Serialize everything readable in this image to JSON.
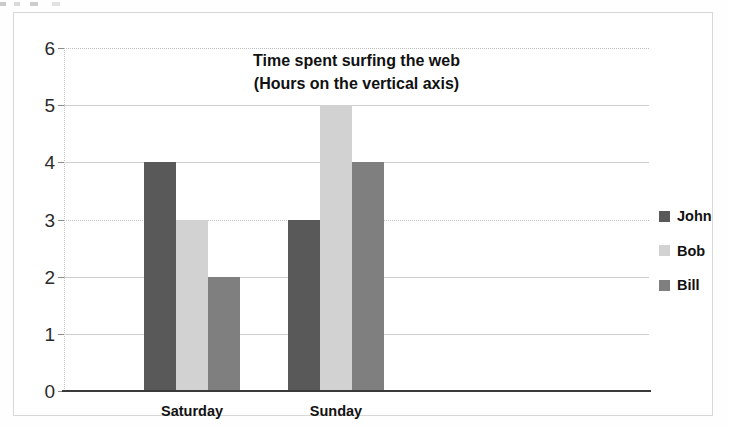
{
  "chart_data": {
    "type": "bar",
    "title": "Time spent surfing the web",
    "subtitle": "(Hours on the vertical axis)",
    "xlabel": "",
    "ylabel": "",
    "categories": [
      "Saturday",
      "Sunday"
    ],
    "series": [
      {
        "name": "John",
        "values": [
          4,
          3
        ],
        "color": "#595959"
      },
      {
        "name": "Bob",
        "values": [
          3,
          5
        ],
        "color": "#d2d2d2"
      },
      {
        "name": "Bill",
        "values": [
          2,
          4
        ],
        "color": "#7f7f7f"
      }
    ],
    "ylim": [
      0,
      6
    ],
    "ytick_step": 1,
    "yticks": [
      "6",
      "5",
      "4",
      "3",
      "2",
      "1",
      "0"
    ],
    "grid": true,
    "legend_position": "right"
  },
  "axes": {
    "y_ticks": [
      {
        "label": "6",
        "value": 6
      },
      {
        "label": "5",
        "value": 5
      },
      {
        "label": "4",
        "value": 4
      },
      {
        "label": "3",
        "value": 3
      },
      {
        "label": "2",
        "value": 2
      },
      {
        "label": "1",
        "value": 1
      },
      {
        "label": "0",
        "value": 0
      }
    ],
    "x_categories": [
      {
        "label": "Saturday"
      },
      {
        "label": "Sunday"
      }
    ]
  },
  "legend": {
    "items": [
      {
        "label": "John",
        "color": "#595959",
        "swatch": "legend-swatch-john"
      },
      {
        "label": "Bob",
        "color": "#d2d2d2",
        "swatch": "legend-swatch-bob"
      },
      {
        "label": "Bill",
        "color": "#7f7f7f",
        "swatch": "legend-swatch-bill"
      }
    ]
  },
  "colors": {
    "john": "#595959",
    "bob": "#d2d2d2",
    "bill": "#7f7f7f",
    "gridline": "#cfcfcf",
    "axis": "#3a3a3a",
    "frame": "#d8d8d8",
    "text": "#111111",
    "background": "#ffffff"
  }
}
